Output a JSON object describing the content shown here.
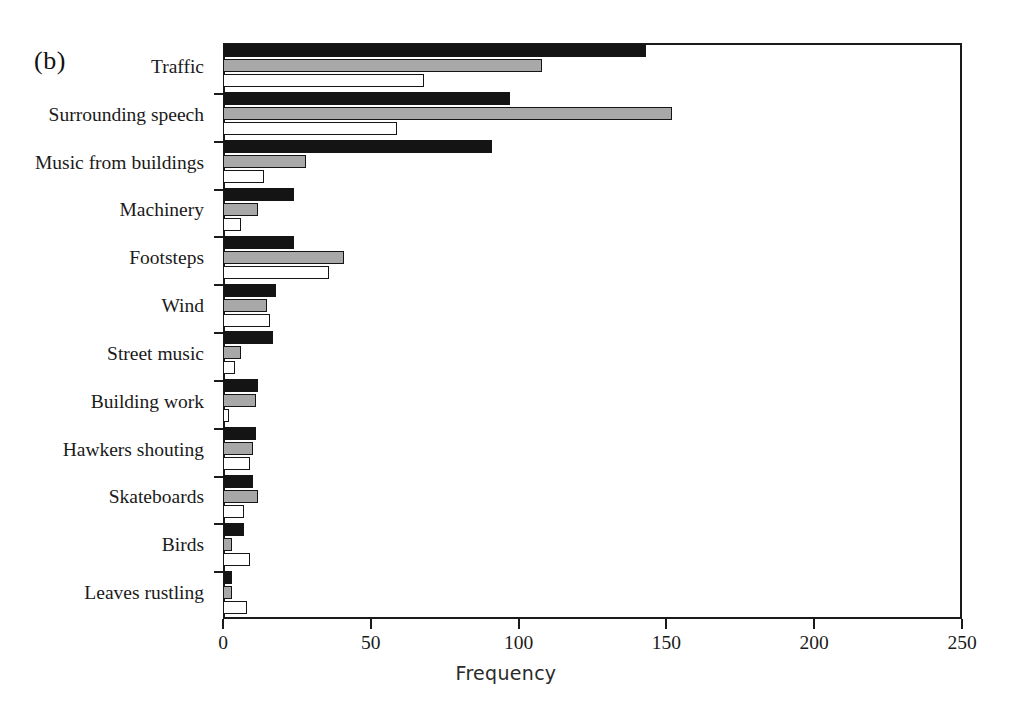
{
  "figure": {
    "panel_label": "(b)",
    "xlabel": "Frequency"
  },
  "axis": {
    "x_ticks": [
      "0",
      "50",
      "100",
      "150",
      "200",
      "250"
    ]
  },
  "categories": [
    "Traffic",
    "Surrounding speech",
    "Music from buildings",
    "Machinery",
    "Footsteps",
    "Wind",
    "Street music",
    "Building work",
    "Hawkers shouting",
    "Skateboards",
    "Birds",
    "Leaves rustling"
  ],
  "chart_data": {
    "type": "bar",
    "orientation": "horizontal",
    "title": "(b)",
    "xlabel": "Frequency",
    "ylabel": "",
    "xlim": [
      0,
      250
    ],
    "grid": false,
    "legend": "none",
    "xticks": [
      0,
      50,
      100,
      150,
      200,
      250
    ],
    "categories": [
      "Traffic",
      "Surrounding speech",
      "Music from buildings",
      "Machinery",
      "Footsteps",
      "Wind",
      "Street music",
      "Building work",
      "Hawkers shouting",
      "Skateboards",
      "Birds",
      "Leaves rustling"
    ],
    "series": [
      {
        "name": "series-1",
        "fill": "#141414",
        "values": [
          143,
          97,
          91,
          24,
          24,
          18,
          17,
          12,
          11,
          10,
          7,
          3
        ]
      },
      {
        "name": "series-2",
        "fill": "#a8a8a8",
        "values": [
          108,
          152,
          28,
          12,
          41,
          15,
          6,
          11,
          10,
          12,
          3,
          3
        ]
      },
      {
        "name": "series-3",
        "fill": "#ffffff",
        "values": [
          68,
          59,
          14,
          6,
          36,
          16,
          4,
          2,
          9,
          7,
          9,
          8
        ]
      }
    ]
  },
  "style": {
    "axis_color": "#1a1a1a",
    "bar_edge_color": "#151515",
    "series_colors": [
      "#141414",
      "#a8a8a8",
      "#ffffff"
    ]
  }
}
